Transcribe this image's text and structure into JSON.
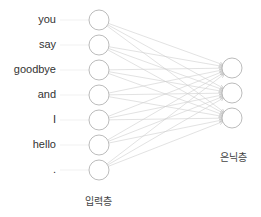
{
  "diagram": {
    "input_layer": {
      "label": "입력층",
      "words": [
        "you",
        "say",
        "goodbye",
        "and",
        "I",
        "hello",
        "."
      ]
    },
    "hidden_layer": {
      "label": "은닉층",
      "node_count": 3
    },
    "connections": "fully-connected",
    "colors": {
      "node_stroke": "#aaaaaa",
      "edge": "#cfcfcf",
      "text": "#333333"
    }
  }
}
